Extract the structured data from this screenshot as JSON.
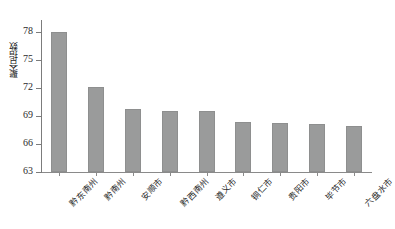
{
  "chart_data": {
    "type": "bar",
    "title": "",
    "xlabel": "",
    "ylabel": "聚合指数",
    "categories": [
      "黔东南州",
      "黔南州",
      "安顺市",
      "黔西南州",
      "遵义市",
      "铜仁市",
      "贵阳市",
      "毕节市",
      "六盘水市"
    ],
    "values": [
      78.0,
      72.1,
      69.7,
      69.55,
      69.55,
      68.4,
      68.3,
      68.1,
      67.9
    ],
    "ylim": [
      63,
      79
    ],
    "yticks": [
      63,
      66,
      69,
      72,
      75,
      78
    ],
    "ytick_labels": [
      "63",
      "66",
      "69",
      "72",
      "75",
      "78"
    ],
    "grid": false,
    "legend": null,
    "series": [
      {
        "name": "聚合指数",
        "values": [
          78.0,
          72.1,
          69.7,
          69.55,
          69.55,
          68.4,
          68.3,
          68.1,
          67.9
        ]
      }
    ],
    "colors": {
      "bar_fill": "#9a9b9b",
      "bar_edge": "#8e8f8f",
      "axis": "#7c7c7c",
      "text": "#1f1f1f",
      "background": "#ffffff"
    }
  }
}
